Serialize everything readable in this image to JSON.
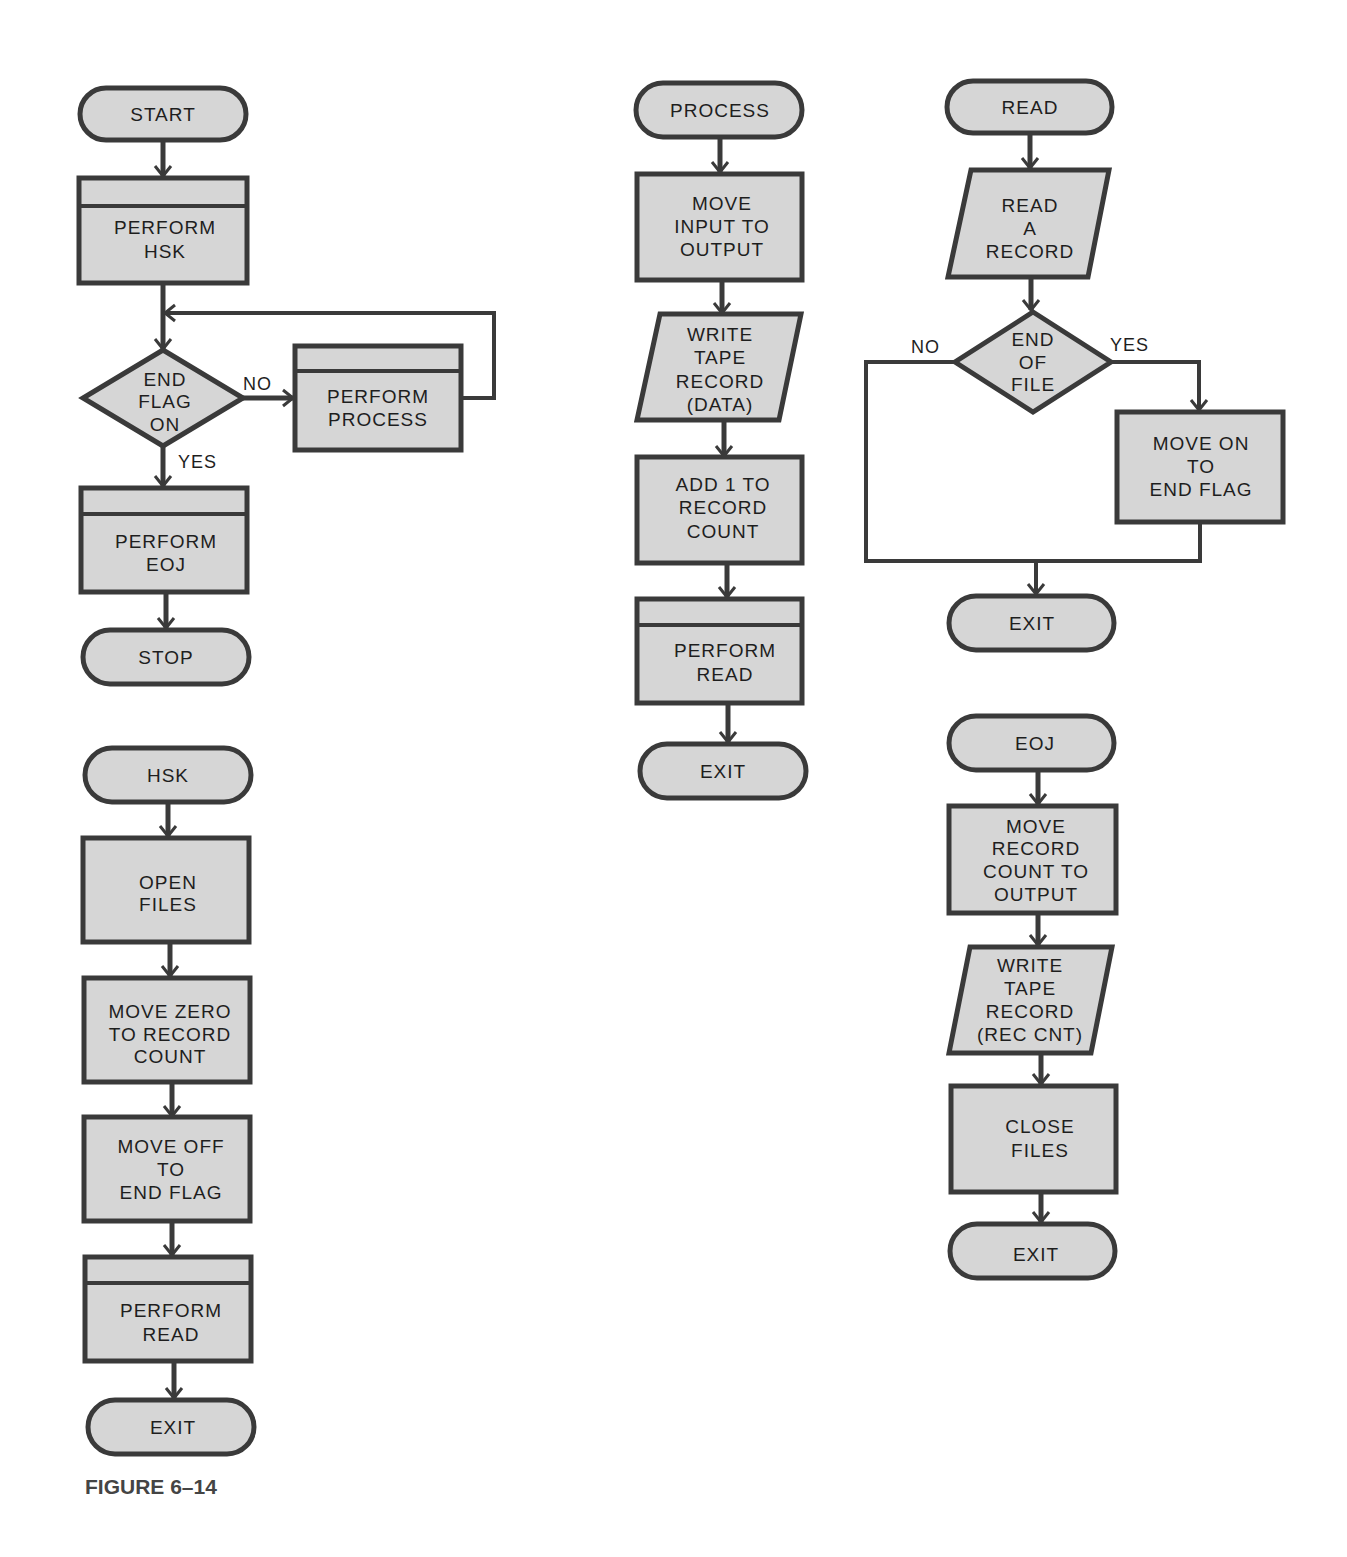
{
  "figure": {
    "caption": "FIGURE 6–14"
  },
  "colors": {
    "fill": "#d6d6d6",
    "stroke": "#3a3a3a",
    "text": "#1e1e1e",
    "background": "#ffffff"
  },
  "main": {
    "start": "START",
    "perform_hsk": [
      "PERFORM",
      "HSK"
    ],
    "decision": [
      "END",
      "FLAG",
      "ON"
    ],
    "no": "NO",
    "yes": "YES",
    "perform_process": [
      "PERFORM",
      "PROCESS"
    ],
    "perform_eoj": [
      "PERFORM",
      "EOJ"
    ],
    "stop": "STOP"
  },
  "hsk": {
    "start": "HSK",
    "open_files": [
      "OPEN",
      "FILES"
    ],
    "move_zero": [
      "MOVE ZERO",
      "TO RECORD",
      "COUNT"
    ],
    "move_off": [
      "MOVE OFF",
      "TO",
      "END FLAG"
    ],
    "perform_read": [
      "PERFORM",
      "READ"
    ],
    "exit": "EXIT"
  },
  "process": {
    "start": "PROCESS",
    "move_input": [
      "MOVE",
      "INPUT TO",
      "OUTPUT"
    ],
    "write_tape": [
      "WRITE",
      "TAPE",
      "RECORD",
      "(DATA)"
    ],
    "add_one": [
      "ADD 1 TO",
      "RECORD",
      "COUNT"
    ],
    "perform_read": [
      "PERFORM",
      "READ"
    ],
    "exit": "EXIT"
  },
  "read": {
    "start": "READ",
    "read_record": [
      "READ",
      "A",
      "RECORD"
    ],
    "decision": [
      "END",
      "OF",
      "FILE"
    ],
    "no": "NO",
    "yes": "YES",
    "move_on": [
      "MOVE ON",
      "TO",
      "END FLAG"
    ],
    "exit": "EXIT"
  },
  "eoj": {
    "start": "EOJ",
    "move_count": [
      "MOVE",
      "RECORD",
      "COUNT TO",
      "OUTPUT"
    ],
    "write_tape": [
      "WRITE",
      "TAPE",
      "RECORD",
      "(REC CNT)"
    ],
    "close_files": [
      "CLOSE",
      "FILES"
    ],
    "exit": "EXIT"
  }
}
